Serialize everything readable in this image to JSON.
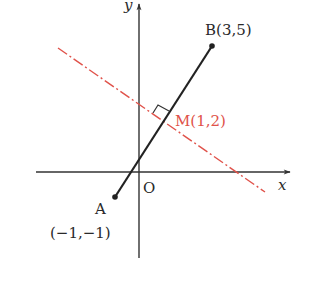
{
  "diagram": {
    "type": "coordinate-geometry",
    "axes": {
      "x_label": "x",
      "y_label": "y",
      "origin_label": "O"
    },
    "points": {
      "A": {
        "name": "A",
        "coords_label": "(−1,−1)",
        "x": -1,
        "y": -1
      },
      "B": {
        "name": "B",
        "coords_label": "B(3,5)",
        "x": 3,
        "y": 5
      },
      "M": {
        "name": "M",
        "coords_label": "M(1,2)",
        "x": 1,
        "y": 2
      }
    },
    "segment": {
      "from": "A",
      "to": "B",
      "color": "#222222"
    },
    "perpendicular_bisector": {
      "through": "M",
      "style": "dash-dot",
      "color": "#e0524a"
    },
    "right_angle_marker": {
      "at": "M"
    },
    "colors": {
      "axis": "#333333",
      "segment": "#222222",
      "bisector": "#e0524a",
      "label": "#2a2a2a",
      "highlight_label": "#e0524a"
    }
  }
}
